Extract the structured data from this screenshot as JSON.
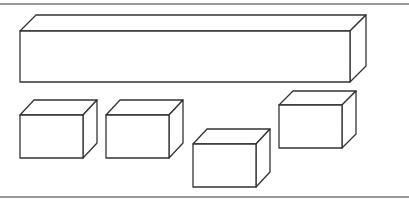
{
  "diagram": {
    "type": "3d-boxes-outline",
    "colors": {
      "background": "#ffffff",
      "stroke": "#333333",
      "rule": "#777777"
    },
    "rules": [
      {
        "name": "top-rule",
        "y": 4
      },
      {
        "name": "bottom-rule",
        "y": 197
      }
    ],
    "depth": {
      "dx": 14,
      "dy": -15
    },
    "boxes": [
      {
        "name": "large-box",
        "x": 20,
        "y": 31,
        "w": 330,
        "h": 51,
        "dx": 16,
        "dy": -16
      },
      {
        "name": "small-box-1",
        "x": 20,
        "y": 115,
        "w": 63,
        "h": 43,
        "dx": 14,
        "dy": -15
      },
      {
        "name": "small-box-2",
        "x": 106,
        "y": 115,
        "w": 63,
        "h": 43,
        "dx": 14,
        "dy": -15
      },
      {
        "name": "small-box-3",
        "x": 193,
        "y": 144,
        "w": 63,
        "h": 43,
        "dx": 14,
        "dy": -15
      },
      {
        "name": "small-box-4",
        "x": 279,
        "y": 105,
        "w": 63,
        "h": 43,
        "dx": 14,
        "dy": -14
      }
    ]
  }
}
